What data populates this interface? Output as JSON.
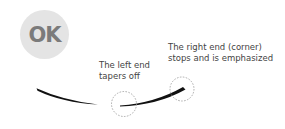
{
  "badge": {
    "text": "OK",
    "background": "#e4e4e4",
    "color": "#7b7b7b"
  },
  "annotations": {
    "right_end": {
      "line1": "The right end (corner)",
      "line2": "stops and is emphasized"
    },
    "left_end": {
      "line1": "The left end",
      "line2": "tapers off"
    }
  },
  "strokes": {
    "color": "#111111",
    "marker_circle_color": "#999999"
  }
}
